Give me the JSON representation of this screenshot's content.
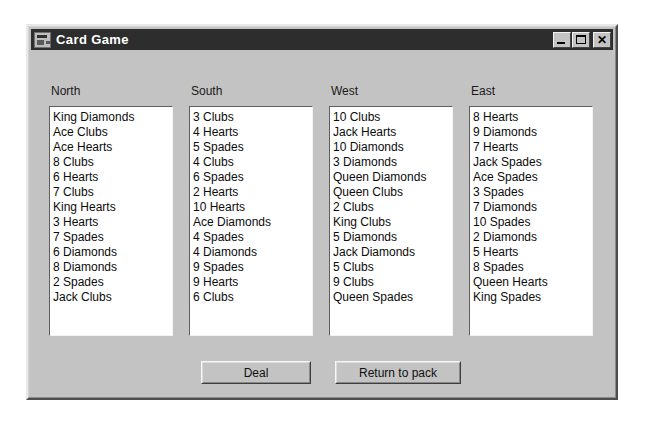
{
  "window": {
    "title": "Card Game",
    "icon": "form-window-icon",
    "controls": [
      {
        "name": "minimize-button",
        "label": "_"
      },
      {
        "name": "maximize-button",
        "label": "□"
      },
      {
        "name": "close-button",
        "label": "×"
      }
    ],
    "colors": {
      "face": "#c3c3c3",
      "titlebar": "#2d2d2d",
      "titlebar_text": "#ffffff",
      "listbox_bg": "#ffffff",
      "text": "#0b0b0b"
    }
  },
  "hands": [
    {
      "label": "North",
      "cards": [
        "King Diamonds",
        "Ace Clubs",
        "Ace Hearts",
        "8 Clubs",
        "6 Hearts",
        "7 Clubs",
        "King Hearts",
        "3 Hearts",
        "7 Spades",
        "6 Diamonds",
        "8 Diamonds",
        "2 Spades",
        "Jack Clubs"
      ]
    },
    {
      "label": "South",
      "cards": [
        "3 Clubs",
        "4 Hearts",
        "5 Spades",
        "4 Clubs",
        "6 Spades",
        "2 Hearts",
        "10 Hearts",
        "Ace Diamonds",
        "4 Spades",
        "4 Diamonds",
        "9 Spades",
        "9 Hearts",
        "6 Clubs"
      ]
    },
    {
      "label": "West",
      "cards": [
        "10 Clubs",
        "Jack Hearts",
        "10 Diamonds",
        "3 Diamonds",
        "Queen Diamonds",
        "Queen Clubs",
        "2 Clubs",
        "King Clubs",
        "5 Diamonds",
        "Jack Diamonds",
        "5 Clubs",
        "9 Clubs",
        "Queen Spades"
      ]
    },
    {
      "label": "East",
      "cards": [
        "8 Hearts",
        "9 Diamonds",
        "7 Hearts",
        "Jack Spades",
        "Ace Spades",
        "3 Spades",
        "7 Diamonds",
        "10 Spades",
        "2 Diamonds",
        "5 Hearts",
        "8 Spades",
        "Queen Hearts",
        "King Spades"
      ]
    }
  ],
  "buttons": {
    "deal": "Deal",
    "return_to_pack": "Return to pack"
  }
}
